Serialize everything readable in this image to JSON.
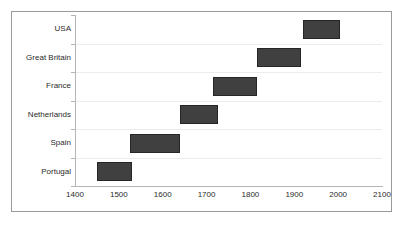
{
  "chart_data": {
    "type": "bar",
    "orientation": "horizontal",
    "subtype": "floating-range-bar",
    "title": "",
    "subtitle": "",
    "xlabel": "",
    "ylabel": "",
    "xlim": [
      1400,
      2100
    ],
    "ylim": [
      0,
      6
    ],
    "grid": true,
    "legend": null,
    "legend_position": "none",
    "xticks": [
      1400,
      1500,
      1600,
      1700,
      1800,
      1900,
      2000,
      2100
    ],
    "xtick_labels": [
      "1400",
      "1500",
      "1600",
      "1700",
      "1800",
      "1900",
      "2000",
      "2100"
    ],
    "categories": [
      "USA",
      "Great Britain",
      "France",
      "Netherlands",
      "Spain",
      "Portugal"
    ],
    "bar_color": "#404040",
    "bar_edge_color": "#262626",
    "background_color": "#ffffff",
    "grid_color": "#ececec",
    "axis_color": "#b5b5b5",
    "series": [
      {
        "name": "Period of dominance",
        "bars": [
          {
            "category": "USA",
            "start": 1920,
            "end": 2005
          },
          {
            "category": "Great Britain",
            "start": 1815,
            "end": 1915
          },
          {
            "category": "France",
            "start": 1715,
            "end": 1815
          },
          {
            "category": "Netherlands",
            "start": 1640,
            "end": 1725
          },
          {
            "category": "Spain",
            "start": 1525,
            "end": 1640
          },
          {
            "category": "Portugal",
            "start": 1450,
            "end": 1530
          }
        ]
      }
    ]
  }
}
